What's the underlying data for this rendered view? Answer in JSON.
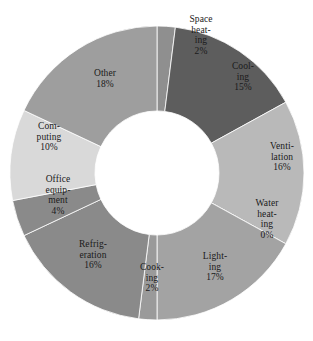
{
  "chart_data": {
    "type": "pie",
    "variant": "donut",
    "title": "",
    "subtitle": "",
    "xlabel": "",
    "ylabel": "",
    "grid": false,
    "legend_position": "none",
    "labels_inside_slices": true,
    "start_angle_deg": 0,
    "direction": "clockwise",
    "inner_radius_ratio": 0.425,
    "categories": [
      "Space heating",
      "Cooling",
      "Ventilation",
      "Water heating",
      "Lighting",
      "Cooking",
      "Refrigeration",
      "Office equipment",
      "Computing",
      "Other"
    ],
    "values": [
      2,
      15,
      16,
      0,
      17,
      2,
      16,
      4,
      10,
      18
    ],
    "value_suffix": "%",
    "colors": [
      "#8f8f8f",
      "#5d5d5d",
      "#b9b9b9",
      "#707070",
      "#a3a3a3",
      "#9a9a9a",
      "#8a8a8a",
      "#8a8a8a",
      "#d9d9d9",
      "#9e9e9e"
    ],
    "slices": [
      {
        "name": "Space heating",
        "value": 2,
        "display_value": "2%",
        "label_lines": "Space\nheat-\ning",
        "color": "#8f8f8f",
        "label_x": 178,
        "label_y": 14,
        "label_width": 46
      },
      {
        "name": "Cooling",
        "value": 15,
        "display_value": "15%",
        "label_lines": "Cool-\ning",
        "color": "#5d5d5d",
        "label_x": 222,
        "label_y": 61,
        "label_width": 42
      },
      {
        "name": "Ventilation",
        "value": 16,
        "display_value": "16%",
        "label_lines": "Venti-\nlation",
        "color": "#b9b9b9",
        "label_x": 256,
        "label_y": 141,
        "label_width": 52
      },
      {
        "name": "Water heating",
        "value": 0,
        "display_value": "0%",
        "label_lines": "Water\nheat-\ning",
        "color": "#707070",
        "label_x": 243,
        "label_y": 198,
        "label_width": 48
      },
      {
        "name": "Lighting",
        "value": 17,
        "display_value": "17%",
        "label_lines": "Light-\ning",
        "color": "#a3a3a3",
        "label_x": 192,
        "label_y": 251,
        "label_width": 46
      },
      {
        "name": "Cooking",
        "value": 2,
        "display_value": "2%",
        "label_lines": "Cook-\ning",
        "color": "#9a9a9a",
        "label_x": 129,
        "label_y": 262,
        "label_width": 46
      },
      {
        "name": "Refrigeration",
        "value": 16,
        "display_value": "16%",
        "label_lines": "Refrig-\neration",
        "color": "#8a8a8a",
        "label_x": 66,
        "label_y": 239,
        "label_width": 54
      },
      {
        "name": "Office equipment",
        "value": 4,
        "display_value": "4%",
        "label_lines": "Office\nequip-\nment",
        "color": "#8a8a8a",
        "label_x": 34,
        "label_y": 174,
        "label_width": 48
      },
      {
        "name": "Computing",
        "value": 10,
        "display_value": "10%",
        "label_lines": "Com-\nputing",
        "color": "#d9d9d9",
        "label_x": 24,
        "label_y": 121,
        "label_width": 50
      },
      {
        "name": "Other",
        "value": 18,
        "display_value": "18%",
        "label_lines": "Other",
        "color": "#9e9e9e",
        "label_x": 81,
        "label_y": 68,
        "label_width": 48
      }
    ],
    "geometry": {
      "center_x": 157,
      "center_y": 173,
      "outer_radius": 147,
      "inner_radius": 62
    }
  }
}
